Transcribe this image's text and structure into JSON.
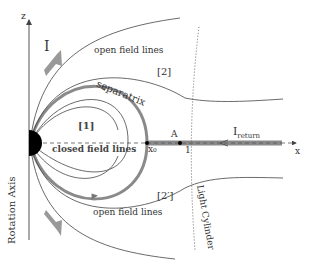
{
  "labels": {
    "z_axis": "z",
    "x_axis": "x",
    "current_I": "I",
    "open_top": "open field lines",
    "open_bottom": "open field lines",
    "region_2": "[2]",
    "region_2p": "[2′]",
    "region_1": "[1]",
    "separatrix": "separatrix",
    "closed": "closed field lines",
    "x0": "x₀",
    "point_A": "A",
    "one": "1",
    "i_return": "I",
    "i_return_sub": "return",
    "rotation_axis": "Rotation Axis",
    "light_cylinder": "Light Cylinder"
  },
  "colors": {
    "line": "#444444",
    "gray": "#999999",
    "thick": "#8a8a8a",
    "star": "#000000"
  }
}
